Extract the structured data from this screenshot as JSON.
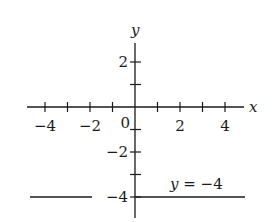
{
  "chart_data": {
    "type": "line",
    "title": "",
    "xlabel": "x",
    "ylabel": "y",
    "xlim": [
      -5,
      5
    ],
    "ylim": [
      -5,
      3
    ],
    "x_ticks": [
      -4,
      -3,
      -2,
      -1,
      1,
      2,
      3,
      4
    ],
    "x_tick_labels": [
      {
        "value": -4,
        "text": "−4"
      },
      {
        "value": -2,
        "text": "−2"
      },
      {
        "value": 2,
        "text": "2"
      },
      {
        "value": 4,
        "text": "4"
      }
    ],
    "y_ticks": [
      2,
      1,
      -1,
      -2,
      -3,
      -4
    ],
    "y_tick_labels": [
      {
        "value": 2,
        "text": "2"
      },
      {
        "value": -2,
        "text": "−2"
      },
      {
        "value": -4,
        "text": "−4"
      }
    ],
    "origin_label": "0",
    "grid": false,
    "series": [
      {
        "name": "y = -4",
        "x": [
          -4.8,
          4.8
        ],
        "y": [
          -4,
          -4
        ]
      }
    ],
    "annotations": [
      {
        "text": "y = −4",
        "x": 3.2,
        "y": -3.6
      }
    ]
  },
  "labels": {
    "x_axis": "x",
    "y_axis": "y",
    "origin": "0",
    "equation": "y = −4"
  },
  "colors": {
    "ink": "#1a1a1a",
    "background": "#ffffff"
  }
}
